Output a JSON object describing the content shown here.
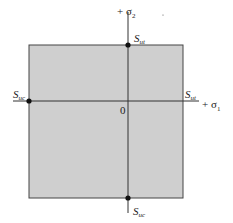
{
  "diagram": {
    "type": "failure-envelope",
    "region_fill": "#cfcfcf",
    "line_color": "#333333",
    "axes": {
      "x": {
        "label_prefix": "+ ",
        "symbol": "σ",
        "subscript": "1"
      },
      "y": {
        "label_prefix": "+ ",
        "symbol": "σ",
        "subscript": "2"
      },
      "origin_label": "0"
    },
    "points": [
      {
        "id": "top",
        "symbol": "S",
        "subscript": "ut"
      },
      {
        "id": "right",
        "symbol": "S",
        "subscript": "ut"
      },
      {
        "id": "left",
        "symbol": "S",
        "subscript": "uc"
      },
      {
        "id": "bottom",
        "symbol": "S",
        "subscript": "uc"
      }
    ]
  }
}
